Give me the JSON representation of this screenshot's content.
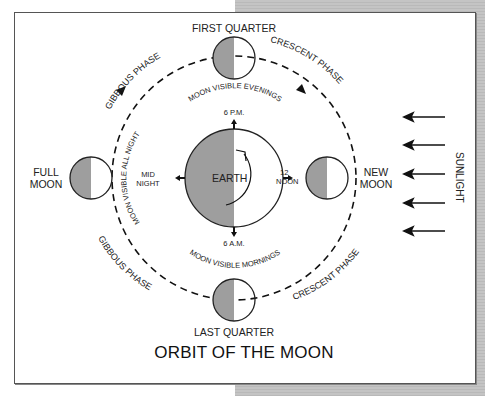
{
  "title": "ORBIT OF THE MOON",
  "colors": {
    "shadow_fill": "#9e9e9e",
    "lit_fill": "#ffffff",
    "outline": "#222222",
    "frame_border": "#555555",
    "background_panel": "#c0c0c0"
  },
  "earth": {
    "label": "EARTH",
    "times": {
      "top": "6 P.M.",
      "bottom": "6 A.M.",
      "left_line1": "MID",
      "left_line2": "NIGHT",
      "right_line1": "12",
      "right_line2": "NOON"
    }
  },
  "moons": {
    "top": "FIRST QUARTER",
    "bottom": "LAST QUARTER",
    "left_line1": "FULL",
    "left_line2": "MOON",
    "right_line1": "NEW",
    "right_line2": "MOON"
  },
  "phases": {
    "top_left": "GIBBOUS PHASE",
    "top_right": "CRESCENT PHASE",
    "bottom_left": "GIBBOUS PHASE",
    "bottom_right": "CRESCENT PHASE"
  },
  "visibility": {
    "evenings": "MOON VISIBLE EVENINGS",
    "mornings": "MOON VISIBLE MORNINGS",
    "all_night": "MOON VISIBLE ALL NIGHT"
  },
  "sunlight": {
    "label": "SUNLIGHT",
    "arrow_count": 5
  }
}
